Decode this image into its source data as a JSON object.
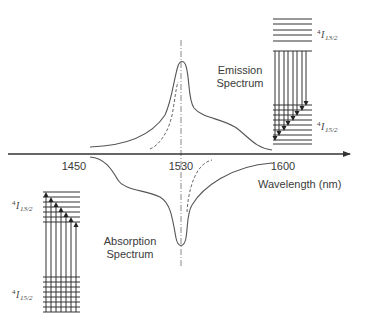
{
  "figure": {
    "axis": {
      "xlabel": "Wavelength (nm)",
      "ticks": [
        {
          "label": "1450",
          "x": 74
        },
        {
          "label": "1530",
          "x": 181
        },
        {
          "label": "1600",
          "x": 283
        }
      ],
      "center_line_wavelength": "1530"
    },
    "emission": {
      "label_line1": "Emission",
      "label_line2": "Spectrum"
    },
    "absorption": {
      "label_line1": "Absorption",
      "label_line2": "Spectrum"
    },
    "right_levels": {
      "upper": {
        "prefix": "4",
        "main": "I",
        "sub": "13/2"
      },
      "lower": {
        "prefix": "4",
        "main": "I",
        "sub": "15/2"
      },
      "transition": "emission (downward arrows)"
    },
    "left_levels": {
      "upper": {
        "prefix": "4",
        "main": "I",
        "sub": "13/2"
      },
      "lower": {
        "prefix": "4",
        "main": "I",
        "sub": "15/2"
      },
      "transition": "absorption (upward arrows)"
    }
  },
  "colors": {
    "line": "#555555",
    "axis": "#333333",
    "text": "#3a3a3a"
  }
}
